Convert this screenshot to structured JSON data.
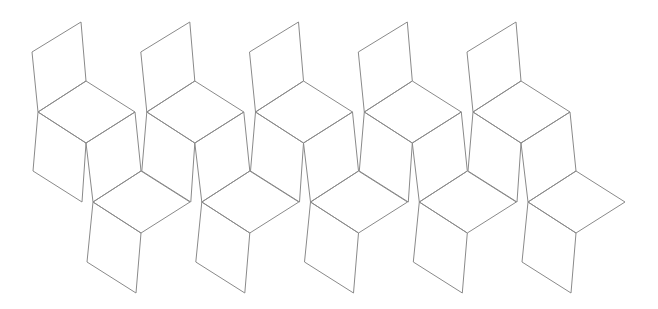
{
  "diagram": {
    "title": "",
    "width": 658,
    "height": 309,
    "background": "#ffffff",
    "stroke_color": "#8a8a8a",
    "unit_count": 5,
    "unit_spacing_x": 108.75,
    "unit_origin": [
      0,
      0
    ],
    "unit_faces": [
      {
        "name": "top-back-face",
        "points": [
          [
            32,
            52
          ],
          [
            81,
            22
          ],
          [
            86,
            81
          ],
          [
            38,
            112
          ]
        ]
      },
      {
        "name": "seat-face",
        "points": [
          [
            38,
            112
          ],
          [
            86,
            81
          ],
          [
            135,
            112
          ],
          [
            86,
            143
          ]
        ]
      },
      {
        "name": "front-left-face",
        "points": [
          [
            38,
            112
          ],
          [
            86,
            143
          ],
          [
            82,
            202
          ],
          [
            33,
            171
          ]
        ]
      },
      {
        "name": "front-right-face",
        "points": [
          [
            86,
            143
          ],
          [
            135,
            112
          ],
          [
            141,
            171
          ],
          [
            93,
            202
          ]
        ]
      },
      {
        "name": "lower-seat-face",
        "points": [
          [
            93,
            202
          ],
          [
            141,
            171
          ],
          [
            190,
            202
          ],
          [
            141,
            233
          ]
        ]
      },
      {
        "name": "lower-front-face",
        "points": [
          [
            93,
            202
          ],
          [
            141,
            233
          ],
          [
            136,
            293
          ],
          [
            87,
            262
          ]
        ]
      }
    ]
  }
}
